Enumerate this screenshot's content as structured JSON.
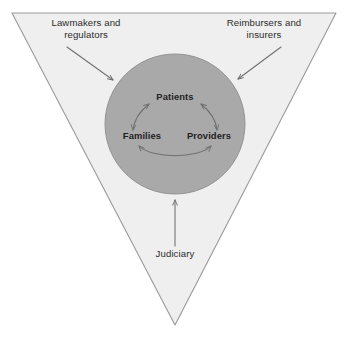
{
  "diagram": {
    "shapes": {
      "triangle": {
        "name": "inverted-triangle",
        "fill": "#efefef",
        "stroke": "#9a9a9a",
        "points": "12,13 336,13 175,325"
      },
      "circle": {
        "name": "core-circle",
        "fill": "#a9a9a9",
        "stroke": "#8f8f8f",
        "cx": 175,
        "cy": 124,
        "r": 70
      }
    },
    "outer_labels": [
      {
        "id": "lawmakers",
        "text": "Lawmakers and\nregulators",
        "position": "top-left"
      },
      {
        "id": "reimbursers",
        "text": "Reimbursers and\ninsurers",
        "position": "top-right"
      },
      {
        "id": "judiciary",
        "text": "Judiciary",
        "position": "bottom-center"
      }
    ],
    "inner_labels": [
      {
        "id": "patients",
        "text": "Patients",
        "position": "top"
      },
      {
        "id": "families",
        "text": "Families",
        "position": "bottom-left"
      },
      {
        "id": "providers",
        "text": "Providers",
        "position": "bottom-right"
      }
    ],
    "arrows": {
      "stroke": "#6f6f6f",
      "external": [
        {
          "id": "lawmakers-arrow",
          "from": "Lawmakers and regulators",
          "to": "core-circle",
          "direction": "down-right",
          "heads": 1
        },
        {
          "id": "reimbursers-arrow",
          "from": "Reimbursers and insurers",
          "to": "core-circle",
          "direction": "down-left",
          "heads": 1
        },
        {
          "id": "judiciary-arrow",
          "from": "Judiciary",
          "to": "core-circle",
          "direction": "up",
          "heads": 1
        }
      ],
      "internal": [
        {
          "id": "patients-families-arc",
          "between": [
            "Patients",
            "Families"
          ],
          "bidirectional": true
        },
        {
          "id": "patients-providers-arc",
          "between": [
            "Patients",
            "Providers"
          ],
          "bidirectional": true
        },
        {
          "id": "families-providers-arc",
          "between": [
            "Families",
            "Providers"
          ],
          "bidirectional": true
        }
      ]
    }
  }
}
